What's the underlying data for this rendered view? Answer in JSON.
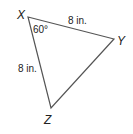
{
  "diagram": {
    "type": "triangle",
    "vertices": {
      "X": {
        "label": "X",
        "x": 28,
        "y": 17
      },
      "Y": {
        "label": "Y",
        "x": 114,
        "y": 39
      },
      "Z": {
        "label": "Z",
        "x": 51,
        "y": 108
      }
    },
    "side_XY": {
      "label": "8 in."
    },
    "side_XZ": {
      "label": "8 in."
    },
    "angle_X": {
      "label": "60°"
    },
    "stroke_color": "#555555"
  }
}
